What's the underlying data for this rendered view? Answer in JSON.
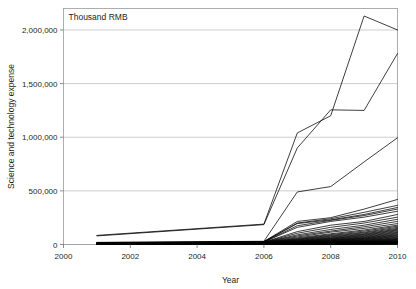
{
  "chart_data": {
    "type": "line",
    "title": "",
    "unit_label": "Thousand RMB",
    "xlabel": "Year",
    "ylabel": "Science and technology expense",
    "xlim": [
      2000,
      2010
    ],
    "ylim": [
      0,
      2200000
    ],
    "xticks": [
      2000,
      2002,
      2004,
      2006,
      2008,
      2010
    ],
    "xtick_labels": [
      "2000",
      "2002",
      "2004",
      "2006",
      "2008",
      "2010"
    ],
    "yticks": [
      0,
      500000,
      1000000,
      1500000,
      2000000
    ],
    "ytick_labels": [
      "0",
      "500,000",
      "1,000,000",
      "1,500,000",
      "2,000,000"
    ],
    "grid": "horizontal",
    "legend": "none",
    "line_color": "#000000",
    "grid_color": "#b9b9b9",
    "x": [
      2001,
      2006,
      2007,
      2008,
      2009,
      2010
    ],
    "series": [
      {
        "name": "region-01",
        "values": [
          85000,
          190000,
          1040000,
          1200000,
          2130000,
          2000000
        ]
      },
      {
        "name": "region-02",
        "values": [
          80000,
          185000,
          900000,
          1255000,
          1250000,
          1780000
        ]
      },
      {
        "name": "region-03",
        "values": [
          20000,
          30000,
          490000,
          540000,
          770000,
          995000
        ]
      },
      {
        "name": "region-04",
        "values": [
          18000,
          28000,
          215000,
          250000,
          330000,
          420000
        ]
      },
      {
        "name": "region-05",
        "values": [
          16000,
          26000,
          200000,
          240000,
          300000,
          365000
        ]
      },
      {
        "name": "region-06",
        "values": [
          15000,
          25000,
          195000,
          230000,
          280000,
          345000
        ]
      },
      {
        "name": "region-07",
        "values": [
          14000,
          24000,
          175000,
          225000,
          270000,
          330000
        ]
      },
      {
        "name": "region-08",
        "values": [
          13000,
          23000,
          160000,
          215000,
          255000,
          310000
        ]
      },
      {
        "name": "region-09",
        "values": [
          12000,
          22000,
          120000,
          180000,
          215000,
          280000
        ]
      },
      {
        "name": "region-10",
        "values": [
          12000,
          21000,
          105000,
          160000,
          200000,
          255000
        ]
      },
      {
        "name": "region-11",
        "values": [
          11000,
          20000,
          90000,
          140000,
          180000,
          235000
        ]
      },
      {
        "name": "region-12",
        "values": [
          11000,
          20000,
          80000,
          125000,
          165000,
          215000
        ]
      },
      {
        "name": "region-13",
        "values": [
          10000,
          19000,
          70000,
          115000,
          150000,
          195000
        ]
      },
      {
        "name": "region-14",
        "values": [
          10000,
          18000,
          62000,
          100000,
          135000,
          180000
        ]
      },
      {
        "name": "region-15",
        "values": [
          9000,
          18000,
          55000,
          92000,
          125000,
          170000
        ]
      },
      {
        "name": "region-16",
        "values": [
          9000,
          17000,
          50000,
          85000,
          115000,
          160000
        ]
      },
      {
        "name": "region-17",
        "values": [
          8000,
          17000,
          46000,
          78000,
          108000,
          150000
        ]
      },
      {
        "name": "region-18",
        "values": [
          8000,
          16000,
          42000,
          72000,
          100000,
          142000
        ]
      },
      {
        "name": "region-19",
        "values": [
          8000,
          16000,
          38000,
          66000,
          94000,
          135000
        ]
      },
      {
        "name": "region-20",
        "values": [
          7000,
          15000,
          35000,
          60000,
          88000,
          128000
        ]
      },
      {
        "name": "region-21",
        "values": [
          7000,
          15000,
          32000,
          56000,
          82000,
          120000
        ]
      },
      {
        "name": "region-22",
        "values": [
          7000,
          14000,
          30000,
          52000,
          76000,
          113000
        ]
      },
      {
        "name": "region-23",
        "values": [
          6000,
          14000,
          28000,
          48000,
          70000,
          106000
        ]
      },
      {
        "name": "region-24",
        "values": [
          6000,
          13000,
          26000,
          44000,
          65000,
          99000
        ]
      },
      {
        "name": "region-25",
        "values": [
          6000,
          13000,
          24000,
          41000,
          60000,
          92000
        ]
      },
      {
        "name": "region-26",
        "values": [
          5000,
          12000,
          22000,
          38000,
          56000,
          86000
        ]
      },
      {
        "name": "region-27",
        "values": [
          5000,
          12000,
          20000,
          35000,
          52000,
          80000
        ]
      },
      {
        "name": "region-28",
        "values": [
          5000,
          11000,
          19000,
          32000,
          48000,
          74000
        ]
      },
      {
        "name": "region-29",
        "values": [
          5000,
          11000,
          17000,
          29000,
          44000,
          68000
        ]
      },
      {
        "name": "region-30",
        "values": [
          4000,
          10000,
          16000,
          27000,
          40000,
          62000
        ]
      },
      {
        "name": "region-31",
        "values": [
          4000,
          10000,
          15000,
          25000,
          37000,
          57000
        ]
      },
      {
        "name": "region-32",
        "values": [
          4000,
          9000,
          14000,
          23000,
          34000,
          52000
        ]
      },
      {
        "name": "region-33",
        "values": [
          4000,
          9000,
          13000,
          21000,
          31000,
          48000
        ]
      },
      {
        "name": "region-34",
        "values": [
          3000,
          8000,
          12000,
          19000,
          28000,
          44000
        ]
      },
      {
        "name": "region-35",
        "values": [
          3000,
          8000,
          11000,
          18000,
          26000,
          40000
        ]
      },
      {
        "name": "region-36",
        "values": [
          3000,
          7000,
          10000,
          16000,
          24000,
          36000
        ]
      },
      {
        "name": "region-37",
        "values": [
          3000,
          7000,
          9500,
          15000,
          22000,
          33000
        ]
      },
      {
        "name": "region-38",
        "values": [
          3000,
          6500,
          9000,
          14000,
          20000,
          30000
        ]
      },
      {
        "name": "region-39",
        "values": [
          2500,
          6000,
          8000,
          13000,
          18000,
          27000
        ]
      },
      {
        "name": "region-40",
        "values": [
          2500,
          6000,
          7500,
          12000,
          17000,
          25000
        ]
      },
      {
        "name": "region-41",
        "values": [
          2000,
          5500,
          7000,
          11000,
          15000,
          22000
        ]
      },
      {
        "name": "region-42",
        "values": [
          2000,
          5000,
          6500,
          10000,
          14000,
          20000
        ]
      },
      {
        "name": "region-43",
        "values": [
          2000,
          4500,
          6000,
          9000,
          12500,
          18000
        ]
      },
      {
        "name": "region-44",
        "values": [
          1800,
          4000,
          5500,
          8000,
          11000,
          16000
        ]
      },
      {
        "name": "region-45",
        "values": [
          1500,
          3500,
          5000,
          7000,
          10000,
          14000
        ]
      },
      {
        "name": "region-46",
        "values": [
          1200,
          3000,
          4500,
          6000,
          8500,
          12000
        ]
      },
      {
        "name": "region-47",
        "values": [
          1000,
          2500,
          4000,
          5200,
          7000,
          10000
        ]
      },
      {
        "name": "region-48",
        "values": [
          800,
          2000,
          3200,
          4200,
          5800,
          8000
        ]
      },
      {
        "name": "region-49",
        "values": [
          600,
          1600,
          2500,
          3400,
          4600,
          6200
        ]
      },
      {
        "name": "region-50",
        "values": [
          400,
          1200,
          1800,
          2500,
          3400,
          4500
        ]
      },
      {
        "name": "region-51",
        "values": [
          300,
          900,
          1300,
          1800,
          2400,
          3200
        ]
      },
      {
        "name": "region-52",
        "values": [
          200,
          600,
          900,
          1200,
          1700,
          2200
        ]
      }
    ]
  }
}
